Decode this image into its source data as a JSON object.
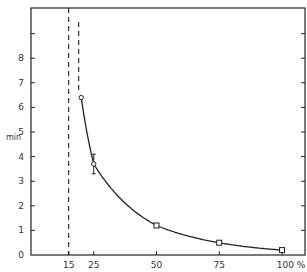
{
  "chart_data": {
    "type": "line",
    "title": "",
    "xlabel": "%",
    "ylabel": "min",
    "xlim": [
      0,
      110
    ],
    "ylim": [
      0,
      10
    ],
    "grid": false,
    "legend": null,
    "x_ticks": [
      15,
      25,
      50,
      75,
      100
    ],
    "x_tick_labels": [
      "15",
      "25",
      "50",
      "75",
      "100 %"
    ],
    "y_ticks": [
      0,
      1,
      2,
      3,
      4,
      5,
      6,
      7,
      8,
      9
    ],
    "y_tick_labels": [
      "0",
      "1",
      "2",
      "3",
      "4",
      "5",
      "6",
      "7",
      "8",
      ""
    ],
    "series": [
      {
        "name": "measured",
        "x": [
          20,
          25,
          50,
          75,
          100
        ],
        "y": [
          6.4,
          3.7,
          1.2,
          0.5,
          0.2
        ],
        "markers": [
          "circle",
          "circle",
          "square",
          "square",
          "square"
        ],
        "error_bars": [
          null,
          [
            3.3,
            4.1
          ],
          null,
          null,
          null
        ]
      }
    ],
    "annotations": [
      {
        "type": "vertical-dashed-line",
        "x": 15
      },
      {
        "type": "vertical-dashed-line",
        "x": 19,
        "note": "asymptote extension of curve above first point"
      }
    ]
  }
}
